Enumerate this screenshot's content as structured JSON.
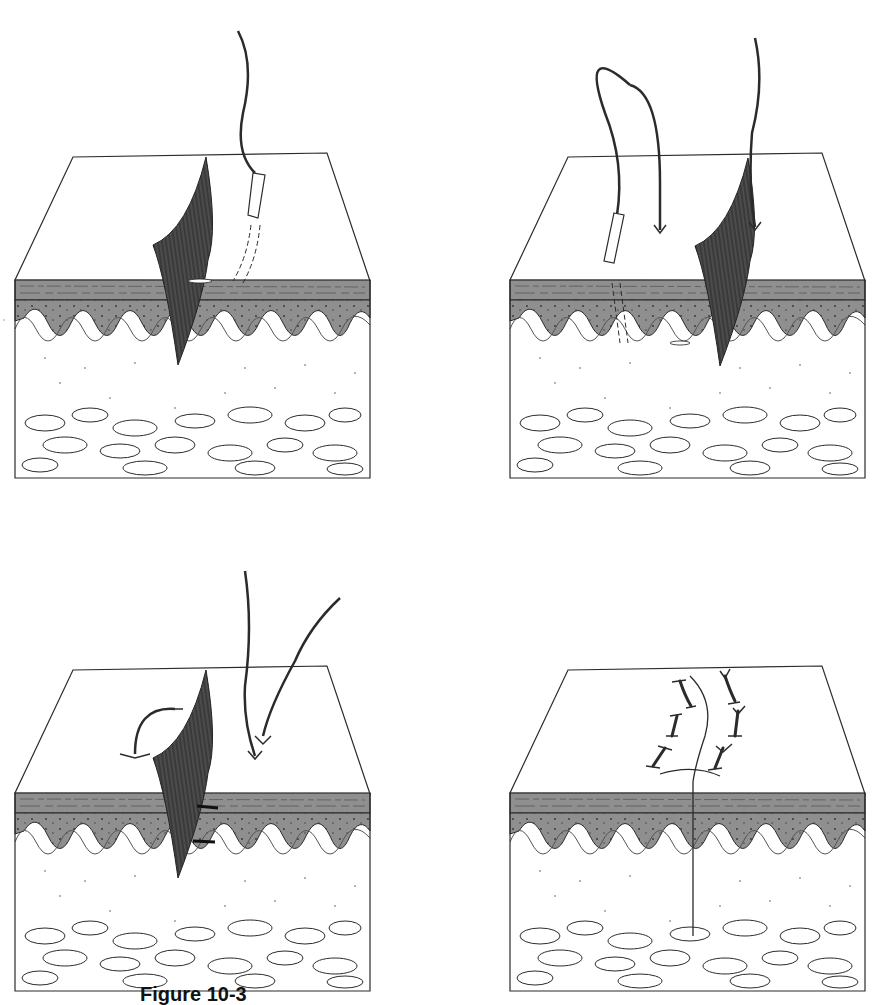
{
  "figure": {
    "caption_label": "Figure 10-3",
    "caption_rest": "",
    "panel_count": 4,
    "panels": [
      {
        "id": "panel-1",
        "step": 1,
        "description": "Flap of skin lifted; needle with suture entering wound edge, path shown dashed through epidermis"
      },
      {
        "id": "panel-2",
        "step": 2,
        "description": "Needle passed through both wound edges; suture loop above skin, two suture ends pointing down"
      },
      {
        "id": "panel-3",
        "step": 3,
        "description": "Suture ends pulled; arrows indicate tying direction over flap"
      },
      {
        "id": "panel-4",
        "step": 4,
        "description": "Wound closed with row of interrupted sutures along incision line"
      }
    ],
    "colors": {
      "line": "#2b2b2b",
      "epidermis_fill": "#8f8f8f",
      "flap_fill": "#3a3a3a",
      "background": "#ffffff"
    }
  }
}
